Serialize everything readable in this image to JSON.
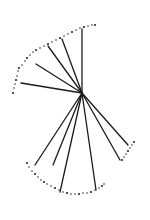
{
  "diagram": {
    "type": "radial-fan-sketch",
    "stroke_color": "#1a1a1a",
    "dot_color": "#2a2a2a",
    "center": [
      82,
      93
    ],
    "rays": [
      {
        "end": [
          82,
          29
        ]
      },
      {
        "end": [
          62,
          39
        ]
      },
      {
        "end": [
          48,
          46
        ]
      },
      {
        "end": [
          36,
          64
        ]
      },
      {
        "end": [
          21,
          83
        ]
      },
      {
        "end": [
          35,
          165
        ]
      },
      {
        "end": [
          53,
          165
        ]
      },
      {
        "end": [
          60,
          192
        ]
      },
      {
        "end": [
          96,
          190
        ]
      },
      {
        "end": [
          120,
          160
        ]
      },
      {
        "end": [
          128,
          145
        ]
      }
    ],
    "dotted_arcs": [
      {
        "name": "upper-arc",
        "points": [
          [
            13,
            93
          ],
          [
            14,
            88
          ],
          [
            15,
            84
          ],
          [
            16,
            80
          ],
          [
            17,
            76
          ],
          [
            18,
            71
          ],
          [
            19,
            68
          ],
          [
            22,
            65
          ],
          [
            25,
            61
          ],
          [
            27,
            58
          ],
          [
            30,
            55
          ],
          [
            33,
            52
          ],
          [
            36,
            50
          ],
          [
            40,
            48
          ],
          [
            44,
            46
          ],
          [
            48,
            44
          ],
          [
            52,
            42
          ],
          [
            56,
            40
          ],
          [
            60,
            38
          ],
          [
            64,
            36
          ],
          [
            68,
            34
          ],
          [
            72,
            32
          ],
          [
            76,
            30
          ],
          [
            80,
            28
          ],
          [
            84,
            27
          ],
          [
            88,
            26
          ],
          [
            92,
            25
          ],
          [
            95,
            25
          ]
        ]
      },
      {
        "name": "lower-arc",
        "points": [
          [
            27,
            163
          ],
          [
            29,
            167
          ],
          [
            32,
            171
          ],
          [
            35,
            174
          ],
          [
            38,
            177
          ],
          [
            41,
            180
          ],
          [
            44,
            182
          ],
          [
            47,
            184
          ],
          [
            51,
            186
          ],
          [
            55,
            188
          ],
          [
            59,
            190
          ],
          [
            63,
            192
          ],
          [
            67,
            193
          ],
          [
            71,
            194
          ],
          [
            75,
            194
          ],
          [
            79,
            194
          ],
          [
            83,
            193
          ],
          [
            87,
            193
          ],
          [
            91,
            192
          ],
          [
            95,
            190
          ],
          [
            99,
            188
          ],
          [
            102,
            186
          ],
          [
            104,
            184
          ]
        ]
      },
      {
        "name": "right-arc",
        "points": [
          [
            122,
            160
          ],
          [
            124,
            157
          ],
          [
            126,
            154
          ],
          [
            128,
            151
          ],
          [
            130,
            148
          ],
          [
            132,
            145
          ],
          [
            134,
            142
          ]
        ]
      }
    ]
  }
}
